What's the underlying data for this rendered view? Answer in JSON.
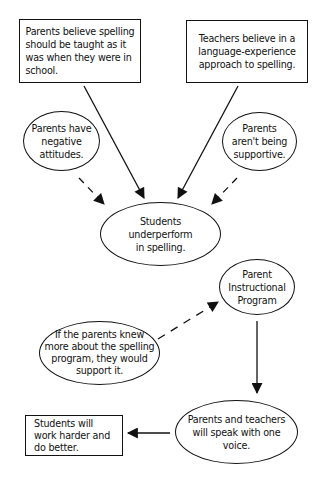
{
  "diagram": {
    "nodes": {
      "parents_belief": {
        "shape": "rectangle",
        "text": "Parents believe spelling\nshould be taught as it\nwas when they were in\nschool."
      },
      "teachers_belief": {
        "shape": "rectangle",
        "text": "Teachers believe in a\nlanguage-experience\napproach to spelling."
      },
      "negative_attitudes": {
        "shape": "ellipse",
        "text": "Parents have\nnegative\nattitudes."
      },
      "not_supportive": {
        "shape": "ellipse",
        "text": "Parents\naren't being\nsupportive."
      },
      "underperform": {
        "shape": "ellipse",
        "text": "Students\nunderperform\nin spelling."
      },
      "instructional_program": {
        "shape": "ellipse",
        "text": "Parent\nInstructional\nProgram"
      },
      "if_parents_knew": {
        "shape": "ellipse",
        "text": "If the parents knew\nmore about the spelling\nprogram, they would\nsupport it."
      },
      "one_voice": {
        "shape": "ellipse",
        "text": "Parents and teachers\nwill speak with one\nvoice."
      },
      "work_harder": {
        "shape": "rectangle",
        "text": "Students will\nwork harder and\ndo better."
      }
    },
    "edges": [
      {
        "from": "parents_belief",
        "to": "underperform",
        "style": "solid"
      },
      {
        "from": "teachers_belief",
        "to": "underperform",
        "style": "solid"
      },
      {
        "from": "negative_attitudes",
        "to": "underperform",
        "style": "dashed"
      },
      {
        "from": "not_supportive",
        "to": "underperform",
        "style": "dashed"
      },
      {
        "from": "if_parents_knew",
        "to": "instructional_program",
        "style": "dashed"
      },
      {
        "from": "instructional_program",
        "to": "one_voice",
        "style": "solid"
      },
      {
        "from": "one_voice",
        "to": "work_harder",
        "style": "solid"
      }
    ],
    "colors": {
      "stroke": "#111111",
      "background": "#ffffff"
    }
  }
}
